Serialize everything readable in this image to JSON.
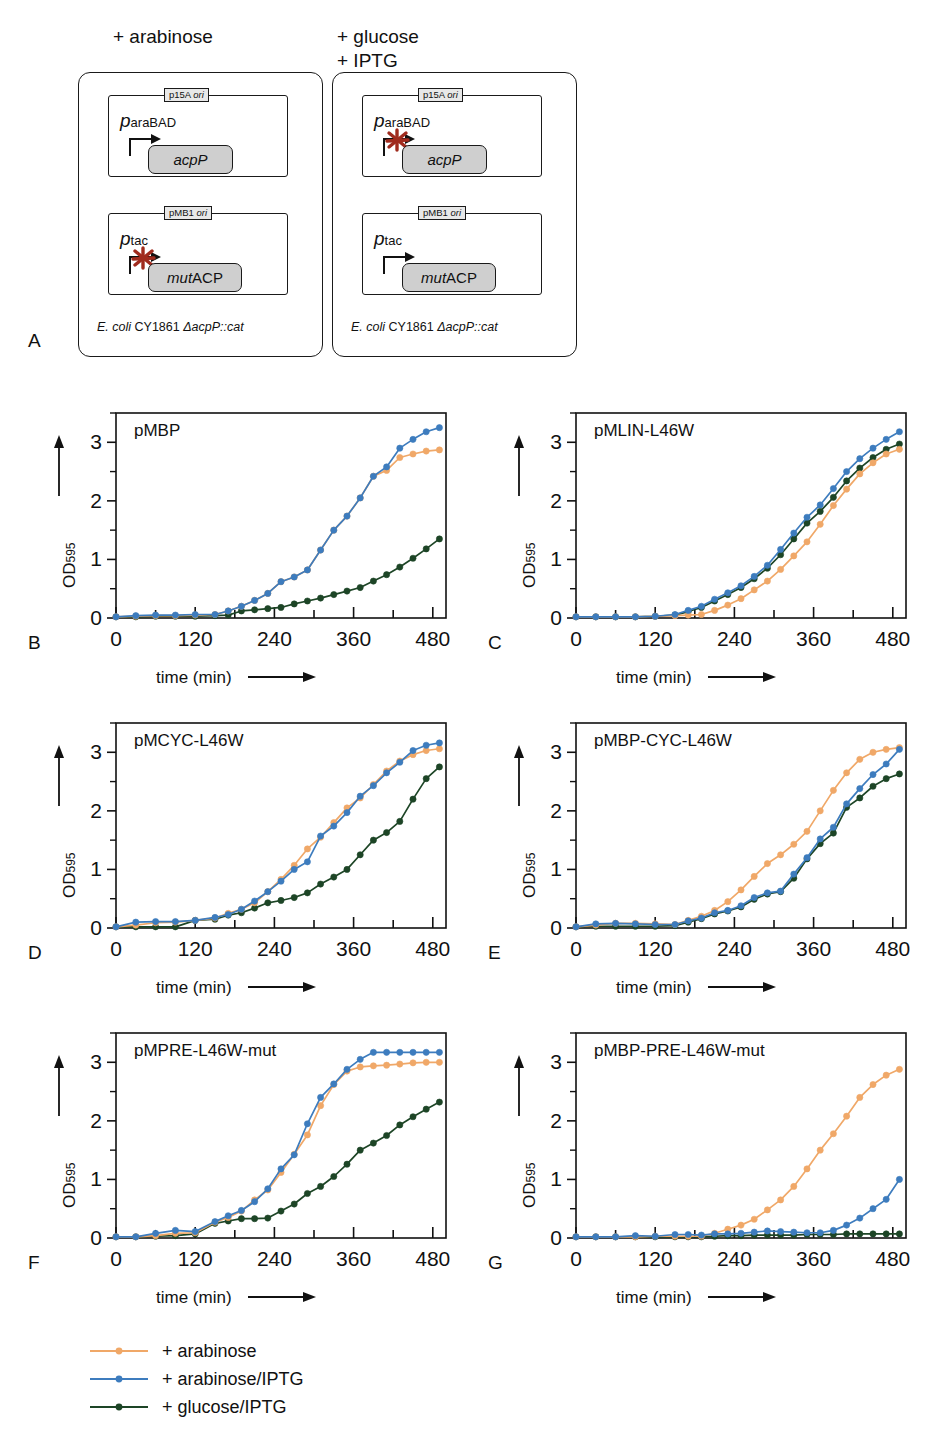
{
  "figure": {
    "panel_labels": [
      "A",
      "B",
      "C",
      "D",
      "E",
      "F",
      "G"
    ]
  },
  "panelA": {
    "label": "A",
    "conditions": [
      {
        "name": "condition-arabinose",
        "text": "+ arabinose"
      },
      {
        "name": "condition-glucose-iptg",
        "text": "+ glucose\n+ IPTG"
      }
    ],
    "strain_prefix": "E. coli",
    "strain_mid": " CY1861 ",
    "strain_suffix": "ΔacpP::cat",
    "left_cell": {
      "plasmid1": {
        "ori": "p15A ",
        "ori_i": "ori",
        "promoter_p": "p",
        "promoter_sub": "araBAD",
        "gene_italic": "acpP",
        "gene_upright": "",
        "blocked": false
      },
      "plasmid2": {
        "ori": "pMB1 ",
        "ori_i": "ori",
        "promoter_p": "p",
        "promoter_sub": "tac",
        "gene_italic": "mut",
        "gene_upright": "ACP",
        "blocked": true
      }
    },
    "right_cell": {
      "plasmid1": {
        "ori": "p15A ",
        "ori_i": "ori",
        "promoter_p": "p",
        "promoter_sub": "araBAD",
        "gene_italic": "acpP",
        "gene_upright": "",
        "blocked": true
      },
      "plasmid2": {
        "ori": "pMB1 ",
        "ori_i": "ori",
        "promoter_p": "p",
        "promoter_sub": "tac",
        "gene_italic": "mut",
        "gene_upright": "ACP",
        "blocked": false
      }
    }
  },
  "legend": {
    "items": [
      {
        "label": "+ arabinose",
        "color": "#f0a868"
      },
      {
        "label": "+ arabinose/IPTG",
        "color": "#3d7cbe"
      },
      {
        "label": "+ glucose/IPTG",
        "color": "#1d4526"
      }
    ]
  },
  "axes": {
    "ylabel_main": "OD",
    "ylabel_sub": "595",
    "xlabel": "time (min)",
    "yticks": [
      0,
      1,
      2,
      3
    ],
    "ytick_labels": [
      "0",
      "1",
      "2",
      "3"
    ],
    "yminor": [
      0.5,
      1.5,
      2.5,
      3.5
    ],
    "xticks": [
      0,
      60,
      120,
      180,
      240,
      300,
      360,
      420,
      480
    ],
    "xtick_labels": [
      "0",
      "120",
      "240",
      "360",
      "480"
    ],
    "xtick_labeled": [
      0,
      120,
      240,
      360,
      480
    ],
    "xlim": [
      0,
      500
    ],
    "ylim": [
      0,
      3.5
    ]
  },
  "chart_data": [
    {
      "panel": "B",
      "type": "line",
      "title": "pMBP",
      "xlabel": "time (min)",
      "ylabel": "OD595",
      "xlim": [
        0,
        500
      ],
      "ylim": [
        0,
        3.5
      ],
      "grid": false,
      "legend_position": "figure-bottom",
      "x": [
        0,
        30,
        60,
        90,
        120,
        150,
        170,
        190,
        210,
        230,
        250,
        270,
        290,
        310,
        330,
        350,
        370,
        390,
        410,
        430,
        450,
        470,
        490
      ],
      "series": [
        {
          "name": "+ arabinose",
          "color": "#f0a868",
          "values": [
            0.02,
            0.03,
            0.04,
            0.04,
            0.05,
            0.06,
            0.12,
            0.2,
            0.3,
            0.42,
            0.62,
            0.7,
            0.82,
            1.16,
            1.5,
            1.74,
            2.05,
            2.42,
            2.52,
            2.74,
            2.8,
            2.85,
            2.87
          ]
        },
        {
          "name": "+ arabinose/IPTG",
          "color": "#3d7cbe",
          "values": [
            0.02,
            0.04,
            0.05,
            0.05,
            0.06,
            0.06,
            0.12,
            0.2,
            0.3,
            0.42,
            0.62,
            0.7,
            0.82,
            1.16,
            1.5,
            1.74,
            2.05,
            2.42,
            2.58,
            2.9,
            3.05,
            3.18,
            3.25
          ]
        },
        {
          "name": "+ glucose/IPTG",
          "color": "#1d4526",
          "values": [
            0.02,
            0.02,
            0.03,
            0.03,
            0.03,
            0.04,
            0.05,
            0.12,
            0.14,
            0.16,
            0.18,
            0.24,
            0.29,
            0.34,
            0.4,
            0.46,
            0.52,
            0.63,
            0.74,
            0.87,
            1.02,
            1.18,
            1.35
          ]
        }
      ]
    },
    {
      "panel": "C",
      "type": "line",
      "title": "pMLIN-L46W",
      "xlabel": "time (min)",
      "ylabel": "OD595",
      "xlim": [
        0,
        500
      ],
      "ylim": [
        0,
        3.5
      ],
      "grid": false,
      "legend_position": "figure-bottom",
      "x": [
        0,
        30,
        60,
        90,
        120,
        150,
        170,
        190,
        210,
        230,
        250,
        270,
        290,
        310,
        330,
        350,
        370,
        390,
        410,
        430,
        450,
        470,
        490
      ],
      "series": [
        {
          "name": "+ arabinose",
          "color": "#f0a868",
          "values": [
            0.02,
            0.02,
            0.02,
            0.02,
            0.03,
            0.04,
            0.05,
            0.06,
            0.13,
            0.22,
            0.33,
            0.48,
            0.63,
            0.83,
            1.06,
            1.3,
            1.6,
            1.92,
            2.2,
            2.46,
            2.65,
            2.8,
            2.88
          ]
        },
        {
          "name": "+ arabinose/IPTG",
          "color": "#3d7cbe",
          "values": [
            0.02,
            0.02,
            0.02,
            0.02,
            0.03,
            0.06,
            0.13,
            0.2,
            0.32,
            0.43,
            0.55,
            0.71,
            0.9,
            1.17,
            1.45,
            1.72,
            1.93,
            2.21,
            2.5,
            2.72,
            2.9,
            3.05,
            3.18
          ]
        },
        {
          "name": "+ glucose/IPTG",
          "color": "#1d4526",
          "values": [
            0.02,
            0.02,
            0.02,
            0.02,
            0.03,
            0.05,
            0.11,
            0.18,
            0.29,
            0.4,
            0.52,
            0.67,
            0.85,
            1.08,
            1.35,
            1.62,
            1.82,
            2.06,
            2.34,
            2.56,
            2.74,
            2.88,
            2.97
          ]
        }
      ]
    },
    {
      "panel": "D",
      "type": "line",
      "title": "pMCYC-L46W",
      "xlabel": "time (min)",
      "ylabel": "OD595",
      "xlim": [
        0,
        500
      ],
      "ylim": [
        0,
        3.5
      ],
      "grid": false,
      "legend_position": "figure-bottom",
      "x": [
        0,
        30,
        60,
        90,
        120,
        150,
        170,
        190,
        210,
        230,
        250,
        270,
        290,
        310,
        330,
        350,
        370,
        390,
        410,
        430,
        450,
        470,
        490
      ],
      "series": [
        {
          "name": "+ arabinose",
          "color": "#f0a868",
          "values": [
            0.02,
            0.05,
            0.09,
            0.1,
            0.13,
            0.17,
            0.25,
            0.32,
            0.43,
            0.62,
            0.83,
            1.07,
            1.35,
            1.55,
            1.8,
            2.05,
            2.22,
            2.45,
            2.68,
            2.85,
            2.96,
            3.03,
            3.06
          ]
        },
        {
          "name": "+ arabinose/IPTG",
          "color": "#3d7cbe",
          "values": [
            0.02,
            0.1,
            0.11,
            0.11,
            0.13,
            0.18,
            0.23,
            0.32,
            0.46,
            0.62,
            0.8,
            1.0,
            1.13,
            1.57,
            1.74,
            1.97,
            2.25,
            2.43,
            2.65,
            2.83,
            3.03,
            3.12,
            3.16
          ]
        },
        {
          "name": "+ glucose/IPTG",
          "color": "#1d4526",
          "values": [
            0.02,
            0.02,
            0.02,
            0.02,
            0.13,
            0.15,
            0.22,
            0.26,
            0.34,
            0.43,
            0.47,
            0.52,
            0.6,
            0.75,
            0.87,
            1.0,
            1.25,
            1.5,
            1.63,
            1.82,
            2.2,
            2.55,
            2.75
          ]
        }
      ]
    },
    {
      "panel": "E",
      "type": "line",
      "title": "pMBP-CYC-L46W",
      "xlabel": "time (min)",
      "ylabel": "OD595",
      "xlim": [
        0,
        500
      ],
      "ylim": [
        0,
        3.5
      ],
      "grid": false,
      "legend_position": "figure-bottom",
      "x": [
        0,
        30,
        60,
        90,
        120,
        150,
        170,
        190,
        210,
        230,
        250,
        270,
        290,
        310,
        330,
        350,
        370,
        390,
        410,
        430,
        450,
        470,
        490
      ],
      "series": [
        {
          "name": "+ arabinose",
          "color": "#f0a868",
          "values": [
            0.02,
            0.05,
            0.08,
            0.08,
            0.07,
            0.06,
            0.13,
            0.2,
            0.3,
            0.45,
            0.65,
            0.88,
            1.1,
            1.25,
            1.43,
            1.65,
            2.0,
            2.35,
            2.65,
            2.88,
            3.0,
            3.05,
            3.08
          ]
        },
        {
          "name": "+ arabinose/IPTG",
          "color": "#3d7cbe",
          "values": [
            0.02,
            0.07,
            0.08,
            0.07,
            0.06,
            0.06,
            0.12,
            0.17,
            0.26,
            0.3,
            0.38,
            0.52,
            0.6,
            0.63,
            0.92,
            1.2,
            1.52,
            1.72,
            2.12,
            2.38,
            2.62,
            2.8,
            3.05
          ]
        },
        {
          "name": "+ glucose/IPTG",
          "color": "#1d4526",
          "values": [
            0.02,
            0.03,
            0.03,
            0.03,
            0.03,
            0.04,
            0.1,
            0.16,
            0.24,
            0.29,
            0.36,
            0.49,
            0.58,
            0.62,
            0.85,
            1.18,
            1.44,
            1.62,
            2.06,
            2.22,
            2.42,
            2.55,
            2.63
          ]
        }
      ]
    },
    {
      "panel": "F",
      "type": "line",
      "title": "pMPRE-L46W-mut",
      "xlabel": "time (min)",
      "ylabel": "OD595",
      "xlim": [
        0,
        500
      ],
      "ylim": [
        0,
        3.5
      ],
      "grid": false,
      "legend_position": "figure-bottom",
      "x": [
        0,
        30,
        60,
        90,
        120,
        150,
        170,
        190,
        210,
        230,
        250,
        270,
        290,
        310,
        330,
        350,
        370,
        390,
        410,
        430,
        450,
        470,
        490
      ],
      "series": [
        {
          "name": "+ arabinose",
          "color": "#f0a868",
          "values": [
            0.02,
            0.02,
            0.04,
            0.08,
            0.09,
            0.27,
            0.35,
            0.46,
            0.65,
            0.82,
            1.12,
            1.43,
            1.76,
            2.26,
            2.62,
            2.85,
            2.92,
            2.94,
            2.95,
            2.97,
            2.99,
            3.0,
            3.0
          ]
        },
        {
          "name": "+ arabinose/IPTG",
          "color": "#3d7cbe",
          "values": [
            0.02,
            0.02,
            0.08,
            0.13,
            0.11,
            0.28,
            0.38,
            0.47,
            0.62,
            0.84,
            1.18,
            1.42,
            1.95,
            2.4,
            2.63,
            2.88,
            3.05,
            3.17,
            3.17,
            3.17,
            3.17,
            3.17,
            3.17
          ]
        },
        {
          "name": "+ glucose/IPTG",
          "color": "#1d4526",
          "values": [
            0.02,
            0.02,
            0.03,
            0.04,
            0.07,
            0.25,
            0.29,
            0.33,
            0.33,
            0.34,
            0.46,
            0.58,
            0.76,
            0.88,
            1.05,
            1.26,
            1.5,
            1.62,
            1.75,
            1.93,
            2.07,
            2.2,
            2.32
          ]
        }
      ]
    },
    {
      "panel": "G",
      "type": "line",
      "title": "pMBP-PRE-L46W-mut",
      "xlabel": "time (min)",
      "ylabel": "OD595",
      "xlim": [
        0,
        500
      ],
      "ylim": [
        0,
        3.5
      ],
      "grid": false,
      "legend_position": "figure-bottom",
      "x": [
        0,
        30,
        60,
        90,
        120,
        150,
        170,
        190,
        210,
        230,
        250,
        270,
        290,
        310,
        330,
        350,
        370,
        390,
        410,
        430,
        450,
        470,
        490
      ],
      "series": [
        {
          "name": "+ arabinose",
          "color": "#f0a868",
          "values": [
            0.02,
            0.02,
            0.02,
            0.02,
            0.03,
            0.03,
            0.03,
            0.03,
            0.08,
            0.15,
            0.22,
            0.32,
            0.48,
            0.65,
            0.88,
            1.18,
            1.5,
            1.78,
            2.08,
            2.4,
            2.62,
            2.78,
            2.88
          ]
        },
        {
          "name": "+ arabinose/IPTG",
          "color": "#3d7cbe",
          "values": [
            0.02,
            0.02,
            0.02,
            0.04,
            0.03,
            0.06,
            0.06,
            0.05,
            0.07,
            0.07,
            0.08,
            0.1,
            0.12,
            0.11,
            0.1,
            0.09,
            0.09,
            0.13,
            0.22,
            0.34,
            0.5,
            0.66,
            1.0
          ]
        },
        {
          "name": "+ glucose/IPTG",
          "color": "#1d4526",
          "values": [
            0.02,
            0.02,
            0.02,
            0.02,
            0.02,
            0.02,
            0.02,
            0.02,
            0.03,
            0.04,
            0.04,
            0.05,
            0.05,
            0.05,
            0.05,
            0.06,
            0.06,
            0.06,
            0.07,
            0.07,
            0.07,
            0.07,
            0.07
          ]
        }
      ]
    }
  ]
}
